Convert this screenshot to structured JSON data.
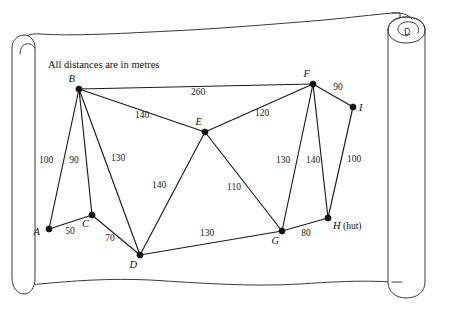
{
  "figure": {
    "caption": "All distances are in metres",
    "units": "metres",
    "background_motif": "parchment-scroll"
  },
  "chart_data": {
    "type": "diagram",
    "subtype": "weighted-undirected-graph",
    "title": "All distances are in metres",
    "xlabel": "",
    "ylabel": "",
    "grid": false,
    "legend": "none",
    "nodes": [
      {
        "id": "A",
        "label": "A",
        "suffix": "",
        "x": 49,
        "y": 229,
        "label_dx": -9,
        "label_dy": 6
      },
      {
        "id": "B",
        "label": "B",
        "suffix": "",
        "x": 79,
        "y": 89,
        "label_dx": -4,
        "label_dy": -7
      },
      {
        "id": "C",
        "label": "C",
        "suffix": "",
        "x": 92,
        "y": 215,
        "label_dx": -3,
        "label_dy": 12
      },
      {
        "id": "D",
        "label": "D",
        "suffix": "",
        "x": 140,
        "y": 255,
        "label_dx": -3,
        "label_dy": 13
      },
      {
        "id": "E",
        "label": "E",
        "suffix": "",
        "x": 205,
        "y": 132,
        "label_dx": -3,
        "label_dy": -7
      },
      {
        "id": "F",
        "label": "F",
        "suffix": "",
        "x": 313,
        "y": 84,
        "label_dx": -3,
        "label_dy": -7
      },
      {
        "id": "G",
        "label": "G",
        "suffix": "",
        "x": 282,
        "y": 231,
        "label_dx": -3,
        "label_dy": 13
      },
      {
        "id": "H",
        "label": "H",
        "suffix": " (hut)",
        "x": 328,
        "y": 218,
        "label_dx": 5,
        "label_dy": 11
      },
      {
        "id": "I",
        "label": "I",
        "suffix": "",
        "x": 353,
        "y": 107,
        "label_dx": 6,
        "label_dy": 4
      }
    ],
    "edges": [
      {
        "from": "A",
        "to": "B",
        "weight": 100,
        "label_x": 46,
        "label_y": 163
      },
      {
        "from": "A",
        "to": "C",
        "weight": 50,
        "label_x": 70,
        "label_y": 234
      },
      {
        "from": "B",
        "to": "C",
        "weight": 90,
        "label_x": 74,
        "label_y": 163
      },
      {
        "from": "B",
        "to": "D",
        "weight": 130,
        "label_x": 118,
        "label_y": 161
      },
      {
        "from": "B",
        "to": "E",
        "weight": 140,
        "label_x": 142,
        "label_y": 118
      },
      {
        "from": "B",
        "to": "F",
        "weight": 260,
        "label_x": 198,
        "label_y": 95
      },
      {
        "from": "C",
        "to": "D",
        "weight": 70,
        "label_x": 110,
        "label_y": 241
      },
      {
        "from": "D",
        "to": "E",
        "weight": 140,
        "label_x": 159,
        "label_y": 188
      },
      {
        "from": "D",
        "to": "G",
        "weight": 130,
        "label_x": 207,
        "label_y": 236
      },
      {
        "from": "E",
        "to": "F",
        "weight": 120,
        "label_x": 262,
        "label_y": 116
      },
      {
        "from": "E",
        "to": "G",
        "weight": 110,
        "label_x": 234,
        "label_y": 190
      },
      {
        "from": "F",
        "to": "G",
        "weight": 130,
        "label_x": 283,
        "label_y": 163
      },
      {
        "from": "F",
        "to": "H",
        "weight": 140,
        "label_x": 313,
        "label_y": 163
      },
      {
        "from": "F",
        "to": "I",
        "weight": 90,
        "label_x": 338,
        "label_y": 90
      },
      {
        "from": "G",
        "to": "H",
        "weight": 80,
        "label_x": 306,
        "label_y": 236
      },
      {
        "from": "H",
        "to": "I",
        "weight": 100,
        "label_x": 354,
        "label_y": 162
      }
    ],
    "node_count": 9,
    "edge_count": 16
  },
  "colors": {
    "ink": "#1a1a1a",
    "paper": "#ffffff",
    "outline": "#3a3a3a"
  }
}
